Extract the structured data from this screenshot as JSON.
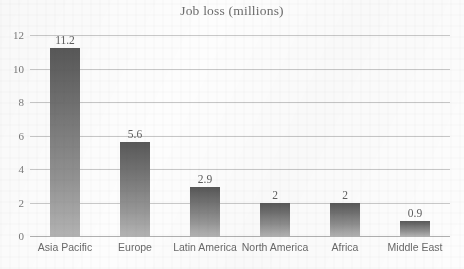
{
  "chart_data": {
    "type": "bar",
    "title": "Job loss (millions)",
    "xlabel": "",
    "ylabel": "",
    "categories": [
      "Asia Pacific",
      "Europe",
      "Latin America",
      "North America",
      "Africa",
      "Middle East"
    ],
    "values": [
      11.2,
      5.6,
      2.9,
      2,
      2,
      0.9
    ],
    "value_labels": [
      "11.2",
      "5.6",
      "2.9",
      "2",
      "2",
      "0.9"
    ],
    "ylim": [
      0,
      12
    ],
    "yticks": [
      0,
      2,
      4,
      6,
      8,
      10,
      12
    ],
    "ytick_labels": [
      "0",
      "2",
      "4",
      "6",
      "8",
      "10",
      "12"
    ],
    "grid": true,
    "grid_axis": "y",
    "legend": false,
    "legend_position": "none",
    "series": [
      {
        "name": "Job loss (millions)",
        "values": [
          11.2,
          5.6,
          2.9,
          2,
          2,
          0.9
        ]
      }
    ],
    "colors": {
      "bar_top": "#585858",
      "bar_bottom": "#b3b3b3",
      "gridline": "#c9c9c9",
      "baseline": "#b0b0b0",
      "title_text": "#6d6d6d",
      "tick_text": "#7a7a7a",
      "category_text": "#6a6a6a",
      "background": "#fdfdfd"
    }
  }
}
